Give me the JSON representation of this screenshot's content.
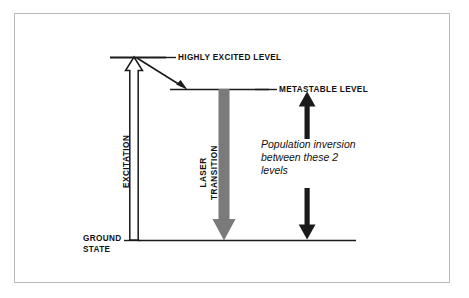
{
  "figure": {
    "kind": "energy-level-diagram",
    "background": "#ffffff",
    "frame_color": "#b9b9b9",
    "ink_color": "#1a1a1a",
    "laser_arrow_color": "#7a7a7a"
  },
  "levels": {
    "highly_excited": {
      "label": "HIGHLY EXCITED LEVEL"
    },
    "metastable": {
      "label": "METASTABLE LEVEL"
    },
    "ground": {
      "label_line1": "GROUND",
      "label_line2": "STATE"
    }
  },
  "arrows": {
    "excitation": {
      "label": "EXCITATION",
      "style": "hollow-outline-up"
    },
    "decay": {
      "style": "solid-diagonal-down"
    },
    "laser": {
      "label_line1": "LASER",
      "label_line2": "TRANSITION",
      "style": "thick-gray-down"
    },
    "inversion_up": {
      "style": "solid-up"
    },
    "inversion_down": {
      "style": "solid-down"
    }
  },
  "annotation": {
    "line1": "Population inversion",
    "line2": "between these 2",
    "line3": "levels"
  }
}
